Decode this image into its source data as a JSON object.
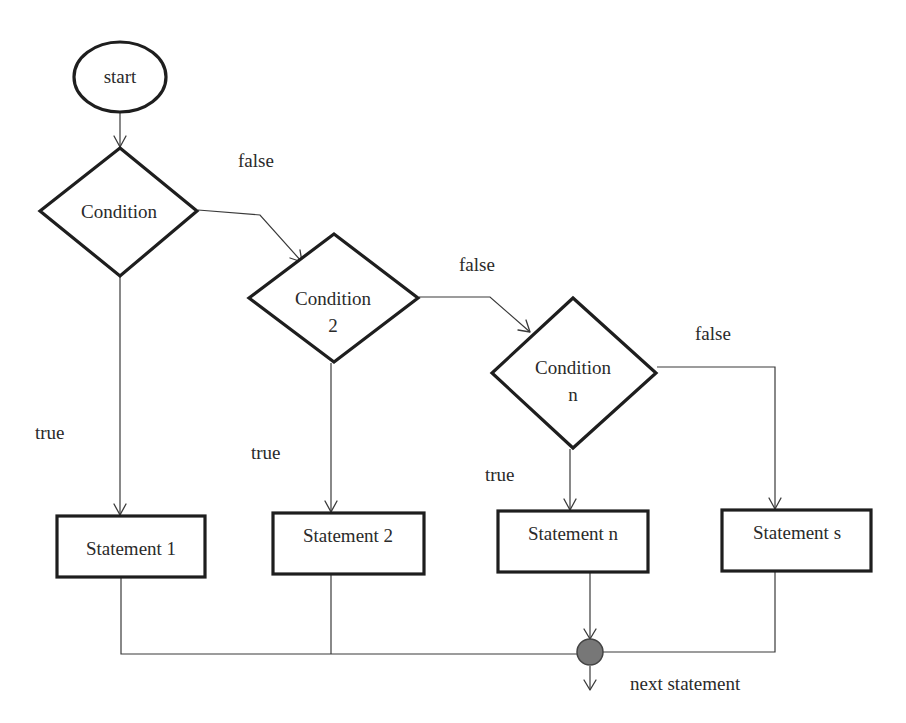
{
  "diagram": {
    "type": "flowchart",
    "nodes": {
      "start": {
        "label": "start",
        "shape": "ellipse"
      },
      "cond1": {
        "line1": "Condition",
        "line2": "",
        "shape": "diamond"
      },
      "cond2": {
        "line1": "Condition",
        "line2": "2",
        "shape": "diamond"
      },
      "condn": {
        "line1": "Condition",
        "line2": "n",
        "shape": "diamond"
      },
      "stmt1": {
        "label": "Statement 1",
        "shape": "rectangle"
      },
      "stmt2": {
        "label": "Statement 2",
        "shape": "rectangle"
      },
      "stmtn": {
        "label": "Statement n",
        "shape": "rectangle"
      },
      "stmts": {
        "label": "Statement s",
        "shape": "rectangle"
      },
      "junction": {
        "shape": "circle",
        "fill": "#777777"
      },
      "next": {
        "label": "next statement"
      }
    },
    "edge_labels": {
      "cond1_false": "false",
      "cond2_false": "false",
      "condn_false": "false",
      "cond1_true": "true",
      "cond2_true": "true",
      "condn_true": "true"
    },
    "edges": [
      {
        "from": "start",
        "to": "cond1",
        "label": ""
      },
      {
        "from": "cond1",
        "to": "stmt1",
        "label": "true"
      },
      {
        "from": "cond1",
        "to": "cond2",
        "label": "false"
      },
      {
        "from": "cond2",
        "to": "stmt2",
        "label": "true"
      },
      {
        "from": "cond2",
        "to": "condn",
        "label": "false"
      },
      {
        "from": "condn",
        "to": "stmtn",
        "label": "true"
      },
      {
        "from": "condn",
        "to": "stmts",
        "label": "false"
      },
      {
        "from": "stmt1",
        "to": "junction",
        "label": ""
      },
      {
        "from": "stmt2",
        "to": "junction",
        "label": ""
      },
      {
        "from": "stmtn",
        "to": "junction",
        "label": ""
      },
      {
        "from": "stmts",
        "to": "junction",
        "label": ""
      },
      {
        "from": "junction",
        "to": "next",
        "label": ""
      }
    ],
    "colors": {
      "stroke": "#1e1e1e",
      "connector": "#3a3a3a",
      "junction_fill": "#777777",
      "background": "#ffffff"
    }
  }
}
